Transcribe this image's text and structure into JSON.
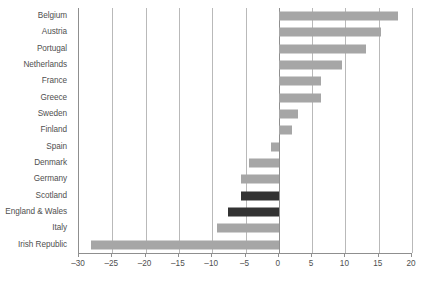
{
  "chart_data": {
    "type": "bar",
    "orientation": "horizontal",
    "title": "",
    "subtitle": "",
    "xlabel": "",
    "ylabel": "",
    "xlim": [
      -30,
      20
    ],
    "ylim": null,
    "grid": true,
    "legend": null,
    "xticks": [
      -30,
      -25,
      -20,
      -15,
      -10,
      -5,
      0,
      5,
      10,
      15,
      20
    ],
    "xtick_labels": [
      "–30",
      "–25",
      "–20",
      "–15",
      "–10",
      "–5",
      "0",
      "5",
      "10",
      "15",
      "20"
    ],
    "categories": [
      "Belgium",
      "Austria",
      "Portugal",
      "Netherlands",
      "France",
      "Greece",
      "Sweden",
      "Finland",
      "Spain",
      "Denmark",
      "Germany",
      "Scotland",
      "England & Wales",
      "Italy",
      "Irish Republic"
    ],
    "values": [
      17.9,
      15.3,
      13.1,
      9.5,
      6.4,
      6.4,
      2.9,
      2.0,
      -1.1,
      -4.5,
      -5.7,
      -5.7,
      -7.7,
      -9.3,
      -28.2
    ],
    "highlight_categories": [
      "Scotland",
      "England & Wales"
    ],
    "colors": {
      "bar_default": "#a6a6a6",
      "bar_highlight": "#333333",
      "gridline": "#b9b9b9",
      "axis": "#8f8f8f",
      "text": "#4f4f4f",
      "background": "#ffffff"
    }
  },
  "footer": {
    "caption": ""
  }
}
